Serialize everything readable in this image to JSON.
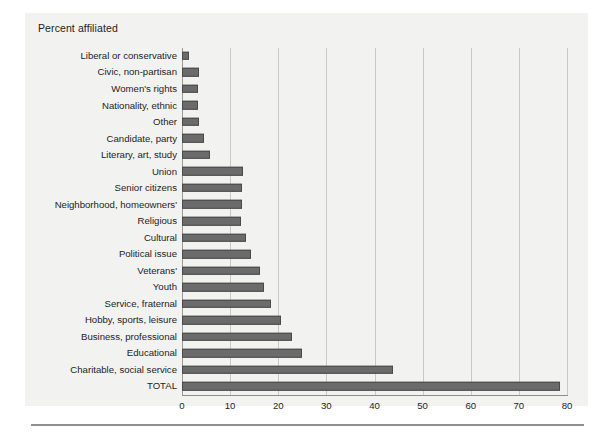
{
  "figure": {
    "title": "Percent affiliated",
    "background_color": "#f2f2f1",
    "bar_color": "#6b6b6b",
    "bar_border_color": "#4a4a4a",
    "gridline_color": "#c9c9c7",
    "axis_color": "#8d8d8b"
  },
  "chart_data": {
    "type": "bar",
    "orientation": "horizontal",
    "title": "Percent affiliated",
    "xlabel": "",
    "ylabel": "",
    "xlim": [
      0,
      80
    ],
    "xticks": [
      0,
      10,
      20,
      30,
      40,
      50,
      60,
      70,
      80
    ],
    "xtick_labels": [
      "0",
      "10",
      "20",
      "30",
      "40",
      "50",
      "60",
      "70",
      "80"
    ],
    "grid": true,
    "legend": false,
    "categories": [
      "Liberal or conservative",
      "Civic, non-partisan",
      "Women's rights",
      "Nationality, ethnic",
      "Other",
      "Candidate, party",
      "Literary, art, study",
      "Union",
      "Senior citizens",
      "Neighborhood, homeowners'",
      "Religious",
      "Cultural",
      "Political issue",
      "Veterans'",
      "Youth",
      "Service, fraternal",
      "Hobby, sports, leisure",
      "Business, professional",
      "Educational",
      "Charitable, social service",
      "TOTAL"
    ],
    "values": [
      1.5,
      3.5,
      3.3,
      3.4,
      3.5,
      4.6,
      5.8,
      12.6,
      12.5,
      12.4,
      12.3,
      13.2,
      14.3,
      16.3,
      17.0,
      18.4,
      20.6,
      22.8,
      24.9,
      43.8,
      78.5
    ]
  }
}
